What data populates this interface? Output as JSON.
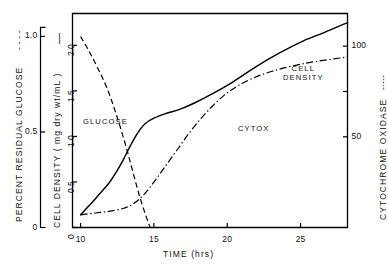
{
  "chart_data": {
    "type": "line",
    "title": "",
    "xlabel": "TIME  (hrs)",
    "xlim": [
      9.45,
      28.2
    ],
    "xticks": [
      10,
      15,
      20,
      25
    ],
    "xticklabels": [
      "10",
      "15",
      "20",
      "25"
    ],
    "grid": false,
    "legend": "inline-curve-labels",
    "axes": [
      {
        "id": "glucose",
        "position": "left-outer",
        "label": "PERCENT  RESIDUAL  GLUCOSE",
        "legend_dash": "- - - -",
        "ylim": [
          0,
          1.12
        ],
        "ticks": [
          0,
          0.5,
          1.0
        ],
        "ticklabels": [
          "0",
          "0.5",
          "1.0"
        ]
      },
      {
        "id": "cell_density",
        "position": "left-inner",
        "label": "CELL  DENSITY  ( mg dry wt/mL )",
        "legend_dash": "——",
        "ylim": [
          0,
          2.35
        ],
        "ticks": [
          0,
          0.5,
          1.0,
          1.5,
          2.0
        ],
        "ticklabels": [
          "0",
          "0.5",
          "1.0",
          "1.5",
          "2.0"
        ]
      },
      {
        "id": "cytochrome_oxidase",
        "position": "right",
        "label": "CYTOCHROME  OXIDASE",
        "legend_dash": "-·-·-",
        "ylim": [
          0,
          118
        ],
        "ticks": [
          50,
          75,
          100
        ],
        "ticklabels": [
          "50",
          "",
          "100"
        ]
      }
    ],
    "series": [
      {
        "name": "GLUCOSE",
        "axis": "glucose",
        "style": "dashed",
        "label_text": "GLUCOSE",
        "x": [
          10.0,
          10.6,
          11.2,
          11.8,
          12.4,
          13.0,
          13.5,
          14.0,
          14.35,
          14.6,
          14.75
        ],
        "y": [
          1.0,
          0.92,
          0.83,
          0.73,
          0.6,
          0.45,
          0.31,
          0.17,
          0.085,
          0.03,
          0.0
        ]
      },
      {
        "name": "CELL DENSITY",
        "axis": "cell_density",
        "style": "solid",
        "label_text": "CELL DENSITY",
        "x": [
          10.0,
          10.7,
          11.3,
          11.9,
          12.4,
          12.9,
          13.4,
          13.9,
          14.4,
          15.0,
          15.8,
          16.8,
          17.8,
          19.0,
          20.4,
          22.0,
          23.6,
          25.2,
          26.6,
          28.2
        ],
        "y": [
          0.14,
          0.26,
          0.37,
          0.48,
          0.6,
          0.74,
          0.9,
          1.04,
          1.14,
          1.2,
          1.25,
          1.3,
          1.37,
          1.47,
          1.6,
          1.77,
          1.92,
          2.05,
          2.14,
          2.25
        ]
      },
      {
        "name": "CYTOX",
        "axis": "cytochrome_oxidase",
        "style": "dashdot",
        "label_text": "CYTOX",
        "x": [
          10.0,
          11.0,
          12.0,
          12.9,
          13.6,
          14.3,
          15.0,
          15.8,
          16.6,
          17.4,
          18.2,
          19.0,
          19.8,
          20.7,
          21.8,
          23.0,
          24.4,
          26.0,
          28.2
        ],
        "y": [
          7.0,
          8.0,
          9.0,
          10.5,
          13.0,
          18.0,
          25.0,
          34.0,
          43.0,
          52.0,
          60.0,
          67.0,
          73.0,
          78.0,
          82.5,
          86.0,
          89.0,
          91.5,
          94.0
        ]
      }
    ]
  },
  "labels": {
    "glucose_axis_title": "PERCENT  RESIDUAL  GLUCOSE",
    "glucose_axis_dash": "- - - -",
    "cell_axis_title": "CELL  DENSITY  ( mg dry wt/mL )",
    "cell_axis_dash": "—",
    "cyt_axis_title": "CYTOCHROME  OXIDASE",
    "cyt_axis_dash": "-·-·-",
    "xaxis_title": "TIME  (hrs)",
    "curve_glucose": "GLUCOSE",
    "curve_cell_1": "CELL",
    "curve_cell_2": "DENSITY",
    "curve_cytox": "CYTOX",
    "gl_t0": "0",
    "gl_t1": "0.5",
    "gl_t2": "1.0",
    "cd_t0": "0",
    "cd_t1": "0.5",
    "cd_t2": "1.0",
    "cd_t3": "1.5",
    "cd_t4": "2.0",
    "cy_t1": "50",
    "cy_t2": "100",
    "x_t0": "10",
    "x_t1": "15",
    "x_t2": "20",
    "x_t3": "25"
  }
}
